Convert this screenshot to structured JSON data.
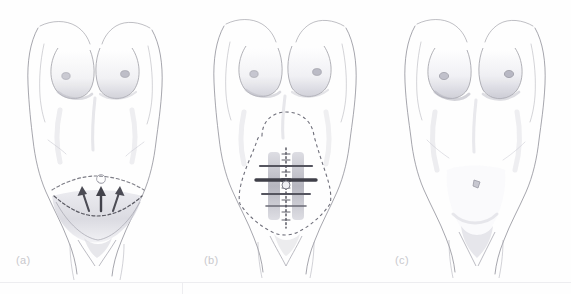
{
  "figure": {
    "background_color": "#fefefe",
    "ink_color": "#7d7d86",
    "marking_color": "#5a5a63",
    "shading_color": "#bcbcc4",
    "caption_color": "#c9c9cd",
    "rule_color": "#ededf0",
    "panels": [
      {
        "id": "a",
        "caption": "(a)",
        "subject": "female-torso-front",
        "stage": "preoperative-marking",
        "markings": [
          "upper-dashed-incision-curve",
          "lower-dashed-incision-curve",
          "excision-crescent-shading",
          "arrow-left",
          "arrow-center",
          "arrow-right",
          "umbilicus"
        ],
        "arrow_count": 3
      },
      {
        "id": "b",
        "caption": "(b)",
        "subject": "female-torso-front",
        "stage": "undermining-and-rectus-plication",
        "markings": [
          "dashed-undermining-outline",
          "rectus-muscle-left",
          "rectus-muscle-right",
          "tendinous-inscriptions",
          "linea-alba-dotted-midline",
          "umbilicus"
        ],
        "rectus_band_count": 2,
        "inscription_count": 4
      },
      {
        "id": "c",
        "caption": "(c)",
        "subject": "female-torso-front",
        "stage": "postoperative-result",
        "markings": [
          "flattened-abdomen",
          "transposed-umbilicus"
        ]
      }
    ]
  }
}
